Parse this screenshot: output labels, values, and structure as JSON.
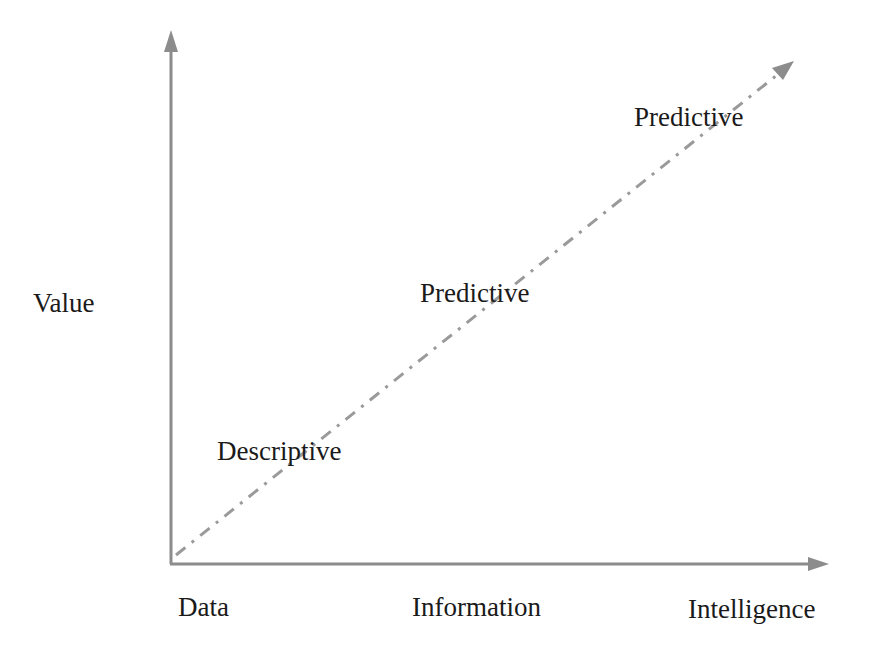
{
  "diagram": {
    "y_axis_label": "Value",
    "x_axis_labels": [
      "Data",
      "Information",
      "Intelligence"
    ],
    "trend_labels": [
      "Descriptive",
      "Predictive",
      "Predictive"
    ],
    "colors": {
      "axis": "#8c8c8c",
      "trend_line": "#9a9a9a",
      "text": "#1a1a1a"
    }
  }
}
